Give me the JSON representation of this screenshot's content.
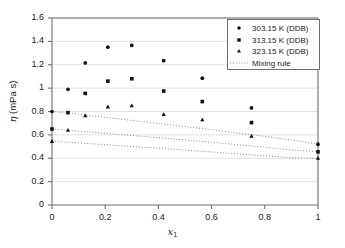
{
  "chart_data": {
    "type": "scatter",
    "title": "",
    "xlabel": "x_1",
    "ylabel": "eta (mPa s)",
    "xlim": [
      0,
      1
    ],
    "ylim": [
      0,
      1.6
    ],
    "xticks": [
      "0",
      "0.2",
      "0.4",
      "0.6",
      "0.8",
      "1"
    ],
    "yticks": [
      "0",
      "0.2",
      "0.4",
      "0.6",
      "0.8",
      "1",
      "1.2",
      "1.4",
      "1.6"
    ],
    "grid": "horizontal",
    "legend_position": "top-right",
    "series": [
      {
        "name": "303.15 K (DDB)",
        "marker": "circle",
        "x": [
          0.0,
          0.06,
          0.125,
          0.21,
          0.3,
          0.42,
          0.565,
          0.75,
          1.0
        ],
        "values": [
          0.8,
          0.99,
          1.215,
          1.35,
          1.365,
          1.235,
          1.085,
          0.83,
          0.52
        ]
      },
      {
        "name": "313.15 K (DDB)",
        "marker": "square",
        "x": [
          0.0,
          0.06,
          0.125,
          0.21,
          0.3,
          0.42,
          0.565,
          0.75,
          1.0
        ],
        "values": [
          0.65,
          0.79,
          0.955,
          1.06,
          1.08,
          0.975,
          0.885,
          0.705,
          0.455
        ]
      },
      {
        "name": "323.15 K (DDB)",
        "marker": "triangle",
        "x": [
          0.0,
          0.06,
          0.125,
          0.21,
          0.3,
          0.42,
          0.565,
          0.75,
          1.0
        ],
        "values": [
          0.545,
          0.64,
          0.765,
          0.84,
          0.85,
          0.775,
          0.73,
          0.59,
          0.4
        ]
      }
    ],
    "mixing_rule": {
      "name": "Mixing rule",
      "style": "dotted",
      "curves": [
        {
          "for": "303.15 K",
          "x": [
            0.0,
            0.1,
            0.2,
            0.3,
            0.4,
            0.5,
            0.6,
            0.7,
            0.8,
            0.9,
            1.0
          ],
          "values": [
            0.8,
            0.775,
            0.75,
            0.724,
            0.698,
            0.671,
            0.644,
            0.616,
            0.587,
            0.556,
            0.52
          ]
        },
        {
          "for": "313.15 K",
          "x": [
            0.0,
            0.1,
            0.2,
            0.3,
            0.4,
            0.5,
            0.6,
            0.7,
            0.8,
            0.9,
            1.0
          ],
          "values": [
            0.65,
            0.632,
            0.614,
            0.595,
            0.576,
            0.557,
            0.537,
            0.516,
            0.494,
            0.47,
            0.455
          ]
        },
        {
          "for": "323.15 K",
          "x": [
            0.0,
            0.1,
            0.2,
            0.3,
            0.4,
            0.5,
            0.6,
            0.7,
            0.8,
            0.9,
            1.0
          ],
          "values": [
            0.545,
            0.531,
            0.516,
            0.501,
            0.486,
            0.47,
            0.454,
            0.437,
            0.42,
            0.404,
            0.4
          ]
        }
      ]
    },
    "legend": [
      {
        "label": "303.15 K (DDB)",
        "marker": "circle"
      },
      {
        "label": "313.15 K (DDB)",
        "marker": "square"
      },
      {
        "label": "323.15 K (DDB)",
        "marker": "triangle"
      },
      {
        "label": "Mixing rule",
        "marker": "dotted-line"
      }
    ],
    "colors": {
      "marker": "#111111",
      "axis": "#6e6e6e",
      "grid": "#e2e2e2",
      "mixing_line": "#8a8a8a",
      "text": "#1a1a1a",
      "background": "#ffffff"
    }
  }
}
